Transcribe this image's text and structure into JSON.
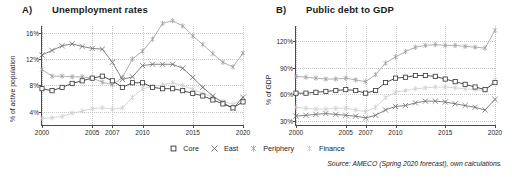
{
  "figure": {
    "source_note": "Source: AMECO (Spring 2020 forecast), own calculations."
  },
  "legend": {
    "items": [
      {
        "label": "Core",
        "marker": "square-marker",
        "color": "#333333"
      },
      {
        "label": "East",
        "marker": "cross-marker",
        "color": "#6e6e6e"
      },
      {
        "label": "Periphery",
        "marker": "asterisk-marker",
        "color": "#a0a0a0"
      },
      {
        "label": "Finance",
        "marker": "asterisk-marker",
        "color": "#cfcfcf"
      }
    ]
  },
  "panels": [
    {
      "letter": "A)",
      "title": "Unemployment rates",
      "chart_data": {
        "type": "line",
        "title": "Unemployment rates",
        "xlabel": "",
        "ylabel": "% of active population",
        "xlim": [
          2000,
          2020
        ],
        "ylim": [
          2,
          17
        ],
        "grid": true,
        "legend_position": "bottom-center",
        "xticks": [
          2000,
          2005,
          2007,
          2010,
          2015,
          2020
        ],
        "yticks": [
          4,
          8,
          12,
          16
        ],
        "ytick_labels": [
          "4%",
          "8%",
          "12%",
          "16%"
        ],
        "x": [
          2000,
          2001,
          2002,
          2003,
          2004,
          2005,
          2006,
          2007,
          2008,
          2009,
          2010,
          2011,
          2012,
          2013,
          2014,
          2015,
          2016,
          2017,
          2018,
          2019,
          2020
        ],
        "series": [
          {
            "name": "Core",
            "marker": "square",
            "color": "#333333",
            "values": [
              7.5,
              7.2,
              7.7,
              8.3,
              8.7,
              9.1,
              9.4,
              8.7,
              7.7,
              8.4,
              8.4,
              7.7,
              7.5,
              7.5,
              7.2,
              6.8,
              6.4,
              5.8,
              5.2,
              4.6,
              5.5
            ]
          },
          {
            "name": "East",
            "marker": "cross",
            "color": "#6e6e6e",
            "values": [
              12.6,
              13.3,
              14.0,
              14.3,
              13.9,
              13.6,
              13.5,
              11.5,
              8.9,
              9.3,
              11.0,
              11.2,
              11.2,
              11.2,
              10.6,
              9.2,
              7.7,
              6.4,
              5.4,
              4.5,
              6.2
            ]
          },
          {
            "name": "Periphery",
            "marker": "asterisk",
            "color": "#a0a0a0",
            "values": [
              10.4,
              9.4,
              9.4,
              9.3,
              9.3,
              9.1,
              8.5,
              8.1,
              9.2,
              12.0,
              13.2,
              15.0,
              17.4,
              17.8,
              17.0,
              15.5,
              14.2,
              12.8,
              11.5,
              10.8,
              12.9
            ]
          },
          {
            "name": "Finance",
            "marker": "asterisk",
            "color": "#cfcfcf",
            "values": [
              3.0,
              3.1,
              3.3,
              3.8,
              4.1,
              4.5,
              4.6,
              4.4,
              4.6,
              6.2,
              7.5,
              7.8,
              8.1,
              8.4,
              8.0,
              7.4,
              6.8,
              6.2,
              5.6,
              5.1,
              6.0
            ]
          }
        ]
      }
    },
    {
      "letter": "B)",
      "title": "Public debt to GDP",
      "chart_data": {
        "type": "line",
        "title": "Public debt to GDP",
        "xlabel": "",
        "ylabel": "% of GDP",
        "xlim": [
          2000,
          2020
        ],
        "ylim": [
          25,
          137
        ],
        "grid": true,
        "legend_position": "bottom-center",
        "xticks": [
          2000,
          2005,
          2007,
          2010,
          2015,
          2020
        ],
        "yticks": [
          30,
          60,
          90,
          120
        ],
        "ytick_labels": [
          "30%",
          "60%",
          "90%",
          "120%"
        ],
        "x": [
          2000,
          2001,
          2002,
          2003,
          2004,
          2005,
          2006,
          2007,
          2008,
          2009,
          2010,
          2011,
          2012,
          2013,
          2014,
          2015,
          2016,
          2017,
          2018,
          2019,
          2020
        ],
        "series": [
          {
            "name": "Core",
            "marker": "square",
            "color": "#333333",
            "values": [
              61,
              61,
              62,
              63,
              64,
              65,
              64,
              61,
              64,
              73,
              78,
              79,
              81,
              81,
              80,
              77,
              74,
              71,
              68,
              65,
              73
            ]
          },
          {
            "name": "East",
            "marker": "cross",
            "color": "#6e6e6e",
            "values": [
              35,
              36,
              37,
              38,
              37,
              36,
              35,
              33,
              36,
              42,
              46,
              47,
              50,
              52,
              52,
              51,
              49,
              47,
              45,
              42,
              54
            ]
          },
          {
            "name": "Periphery",
            "marker": "asterisk",
            "color": "#a0a0a0",
            "values": [
              80,
              79,
              78,
              77,
              77,
              78,
              76,
              74,
              82,
              95,
              102,
              108,
              113,
              115,
              116,
              115,
              115,
              114,
              113,
              112,
              132
            ]
          },
          {
            "name": "Finance",
            "marker": "asterisk",
            "color": "#cfcfcf",
            "values": [
              45,
              44,
              43,
              43,
              44,
              44,
              42,
              40,
              45,
              56,
              62,
              64,
              66,
              67,
              68,
              68,
              67,
              66,
              65,
              64,
              76
            ]
          }
        ]
      }
    }
  ]
}
